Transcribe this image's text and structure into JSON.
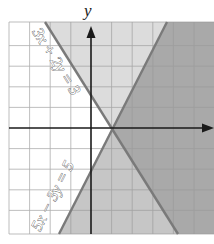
{
  "graph": {
    "axis_labels": {
      "y": "y"
    },
    "equations": [
      {
        "label": "3x + 2y = 3",
        "line": [
          [
            45,
            22
          ],
          [
            178,
            234
          ]
        ]
      },
      {
        "label": "5x − 3y = 5",
        "line": [
          [
            59,
            234
          ],
          [
            167,
            22
          ]
        ]
      }
    ],
    "colors": {
      "background": "#ffffff",
      "grid": "#9a9a9a",
      "region_top": "#dcdcdc",
      "region_bottom": "#c6c6c6",
      "region_overlap": "#a9a9a9",
      "boundary": "#7a7a7a",
      "axis": "#1a1a1a"
    },
    "plot": {
      "left": 9,
      "top": 22,
      "right": 214,
      "bottom": 234,
      "origin_x": 91,
      "origin_y": 128,
      "unit": 20.6
    }
  }
}
